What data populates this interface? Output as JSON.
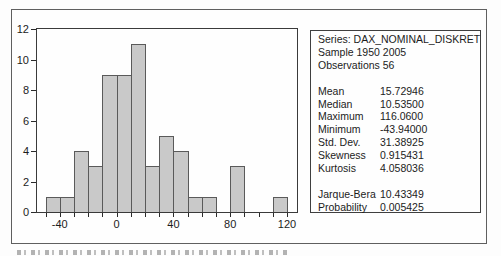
{
  "colors": {
    "bar_fill": "#c9c9c9",
    "bar_border": "#5a5a5a",
    "axis": "#2b2b2b",
    "frame": "#5f5f5f",
    "background": "#fefefe"
  },
  "chart_data": {
    "type": "bar",
    "subtype": "histogram",
    "title": "",
    "xlabel": "",
    "ylabel": "",
    "xlim": [
      -56,
      127
    ],
    "ylim": [
      0,
      12
    ],
    "grid": false,
    "bin_width": 10,
    "bins": [
      {
        "start": -50,
        "end": -40,
        "count": 1
      },
      {
        "start": -40,
        "end": -30,
        "count": 1
      },
      {
        "start": -30,
        "end": -20,
        "count": 4
      },
      {
        "start": -20,
        "end": -10,
        "count": 3
      },
      {
        "start": -10,
        "end": 0,
        "count": 9
      },
      {
        "start": 0,
        "end": 10,
        "count": 9
      },
      {
        "start": 10,
        "end": 20,
        "count": 11
      },
      {
        "start": 20,
        "end": 30,
        "count": 3
      },
      {
        "start": 30,
        "end": 40,
        "count": 5
      },
      {
        "start": 40,
        "end": 50,
        "count": 4
      },
      {
        "start": 50,
        "end": 60,
        "count": 1
      },
      {
        "start": 60,
        "end": 70,
        "count": 1
      },
      {
        "start": 80,
        "end": 90,
        "count": 3
      },
      {
        "start": 110,
        "end": 120,
        "count": 1
      }
    ],
    "x_minor_ticks": [
      -50,
      -40,
      -30,
      -20,
      -10,
      0,
      10,
      20,
      30,
      40,
      50,
      60,
      70,
      80,
      90,
      100,
      110,
      120
    ],
    "x_tick_labels": [
      {
        "value": -40,
        "label": "-40"
      },
      {
        "value": 0,
        "label": "0"
      },
      {
        "value": 40,
        "label": "40"
      },
      {
        "value": 80,
        "label": "80"
      },
      {
        "value": 120,
        "label": "120"
      }
    ],
    "y_tick_labels": [
      {
        "value": 0,
        "label": "0"
      },
      {
        "value": 2,
        "label": "2"
      },
      {
        "value": 4,
        "label": "4"
      },
      {
        "value": 6,
        "label": "6"
      },
      {
        "value": 8,
        "label": "8"
      },
      {
        "value": 10,
        "label": "10"
      },
      {
        "value": 12,
        "label": "12"
      }
    ],
    "legend_position": "none"
  },
  "stats_panel": {
    "rows": [
      {
        "type": "text",
        "text": "Series: DAX_NOMINAL_DISKRET"
      },
      {
        "type": "text",
        "text": "Sample 1950 2005"
      },
      {
        "type": "text",
        "text": "Observations 56"
      },
      {
        "type": "blank"
      },
      {
        "type": "stat",
        "label": "Mean",
        "value": "15.72946"
      },
      {
        "type": "stat",
        "label": "Median",
        "value": "10.53500"
      },
      {
        "type": "stat",
        "label": "Maximum",
        "value": "116.0600"
      },
      {
        "type": "stat",
        "label": "Minimum",
        "value": "-43.94000"
      },
      {
        "type": "stat",
        "label": "Std. Dev.",
        "value": "31.38925"
      },
      {
        "type": "stat",
        "label": "Skewness",
        "value": "0.915431"
      },
      {
        "type": "stat",
        "label": "Kurtosis",
        "value": "4.058036"
      },
      {
        "type": "blank"
      },
      {
        "type": "stat",
        "label": "Jarque-Bera",
        "value": "10.43349"
      },
      {
        "type": "stat",
        "label": "Probability",
        "value": "0.005425"
      }
    ]
  }
}
